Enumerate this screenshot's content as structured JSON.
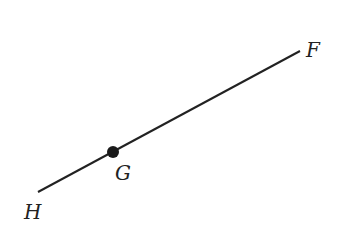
{
  "diagram": {
    "type": "ray",
    "line": {
      "from": {
        "x": 38,
        "y": 192
      },
      "to": {
        "x": 300,
        "y": 51
      },
      "color": "#222222",
      "width": 2
    },
    "points": [
      {
        "id": "F",
        "label": "F",
        "x": 300,
        "y": 51,
        "marked": false,
        "label_x": 306,
        "label_y": 57
      },
      {
        "id": "G",
        "label": "G",
        "x": 113,
        "y": 152,
        "marked": true,
        "label_x": 115,
        "label_y": 180
      },
      {
        "id": "H",
        "label": "H",
        "x": 38,
        "y": 192,
        "marked": false,
        "label_x": 24,
        "label_y": 219
      }
    ],
    "dot_radius": 6,
    "dot_color": "#1a1a1a"
  }
}
